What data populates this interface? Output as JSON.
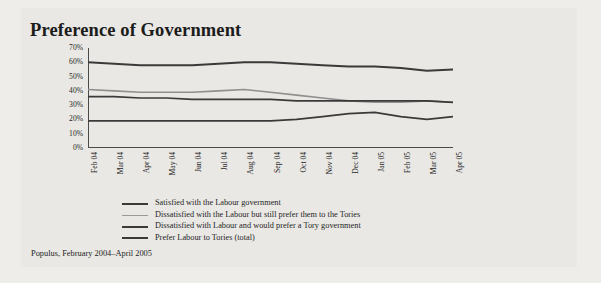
{
  "figure": {
    "title": "Preference of Government",
    "source_note": "Populus, February 2004–April 2005",
    "background_color": "#eeedea",
    "panel_color": "#e9e8e4"
  },
  "chart_data": {
    "type": "line",
    "title": "Preference of Government",
    "xlabel": "",
    "ylabel": "",
    "ylim": [
      0,
      70
    ],
    "ytick_labels": [
      "70%",
      "60%",
      "50%",
      "40%",
      "30%",
      "20%",
      "10%",
      "0%"
    ],
    "ytick_values": [
      70,
      60,
      50,
      40,
      30,
      20,
      10,
      0
    ],
    "grid": false,
    "legend_position": "below-axes",
    "categories": [
      "Feb 04",
      "Mar 04",
      "Apr 04",
      "May 04",
      "Jun 04",
      "Jul 04",
      "Aug 04",
      "Sep 04",
      "Oct 04",
      "Nov 04",
      "Dec 04",
      "Jan 05",
      "Feb 05",
      "Mar 05",
      "Apr 05"
    ],
    "series": [
      {
        "name": "Satisfied with the Labour government",
        "color": "#3a3a3a",
        "width": 2.0,
        "values": [
          60,
          59,
          58,
          58,
          58,
          59,
          60,
          60,
          59,
          58,
          57,
          57,
          56,
          54,
          55
        ]
      },
      {
        "name": "Dissatisfied with the Labour but still prefer them to the Tories",
        "color": "#8f8f8f",
        "width": 1.6,
        "values": [
          41,
          40,
          39,
          39,
          39,
          40,
          41,
          39,
          37,
          35,
          33,
          32,
          32,
          33,
          32
        ]
      },
      {
        "name": "Dissatisfied with Labour and would prefer a Tory government",
        "color": "#3a3a3a",
        "width": 1.7,
        "values": [
          36,
          36,
          35,
          35,
          34,
          34,
          34,
          34,
          33,
          33,
          33,
          33,
          33,
          33,
          32
        ]
      },
      {
        "name": "Prefer Labour to Tories (total)",
        "color": "#3a3a3a",
        "width": 1.7,
        "values": [
          19,
          19,
          19,
          19,
          19,
          19,
          19,
          19,
          20,
          22,
          24,
          25,
          22,
          20,
          22
        ]
      }
    ]
  },
  "legend": {
    "items": [
      {
        "label": "Satisfied with the Labour government",
        "color": "#3a3a3a",
        "width": 2.2
      },
      {
        "label": "Dissatisfied with the Labour but still prefer them to the Tories",
        "color": "#9a9a9a",
        "width": 1.6
      },
      {
        "label": "Dissatisfied with Labour and would prefer a Tory government",
        "color": "#3a3a3a",
        "width": 2.2
      },
      {
        "label": "Prefer Labour to Tories (total)",
        "color": "#3a3a3a",
        "width": 2.2
      }
    ]
  }
}
